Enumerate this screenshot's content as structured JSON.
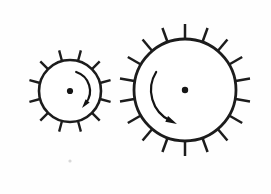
{
  "figure": {
    "caption": "",
    "background_color": "#fefefe",
    "ink_color": "#1c1c1c",
    "canvas": {
      "width": 271,
      "height": 194
    }
  },
  "gears": [
    {
      "id": "small-gear",
      "label": "Small gear",
      "center_x": 70,
      "center_y": 91,
      "body_radius": 31,
      "tooth_length": 11,
      "tooth_count": 12,
      "tooth_angle_offset": -75,
      "body_stroke_width": 2.6,
      "tooth_stroke_width": 2.4,
      "hub_radius": 3.1,
      "rotation_label": "clockwise",
      "arrow": {
        "radius": 20,
        "start_angle": -72,
        "end_angle": 38,
        "stroke_width": 2.2,
        "head_size": 6.4
      }
    },
    {
      "id": "large-gear",
      "label": "Large gear",
      "center_x": 185,
      "center_y": 90,
      "body_radius": 51,
      "tooth_length": 15,
      "tooth_count": 18,
      "tooth_angle_offset": -90,
      "body_stroke_width": 2.8,
      "tooth_stroke_width": 2.5,
      "hub_radius": 3.2,
      "rotation_label": "counterclockwise",
      "arrow": {
        "radius": 34,
        "start_angle": -148,
        "end_angle": -244,
        "stroke_width": 2.2,
        "head_size": 8.0
      }
    }
  ],
  "specks": [
    {
      "x": 70,
      "y": 161,
      "r": 1.6
    }
  ],
  "chart_data": {
    "type": "diagram",
    "elements": [
      {
        "name": "small gear",
        "center": [
          70,
          91
        ],
        "pitch_radius": 31,
        "teeth": 12,
        "rotation": "clockwise"
      },
      {
        "name": "large gear",
        "center": [
          185,
          90
        ],
        "pitch_radius": 51,
        "teeth": 18,
        "rotation": "counterclockwise"
      }
    ],
    "center_distance": 115
  }
}
